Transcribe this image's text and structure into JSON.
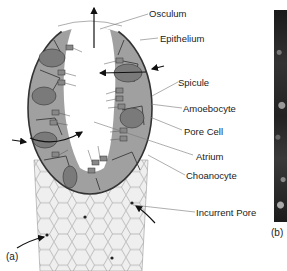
{
  "figure": {
    "panel_a_label": "(a)",
    "panel_b_label": "(b)",
    "labels": [
      {
        "id": "osculum",
        "text": "Osculum"
      },
      {
        "id": "epithelium",
        "text": "Epithelium"
      },
      {
        "id": "spicule",
        "text": "Spicule"
      },
      {
        "id": "amoebocyte",
        "text": "Amoebocyte"
      },
      {
        "id": "pore-cell",
        "text": "Pore Cell"
      },
      {
        "id": "atrium",
        "text": "Atrium"
      },
      {
        "id": "choanocyte",
        "text": "Choanocyte"
      },
      {
        "id": "incurrent-pore",
        "text": "Incurrent Pore"
      }
    ],
    "colors": {
      "wall_fill": "#9a9a9a",
      "wall_outline": "#3a3a3a",
      "cell_fill": "#7c7c7c",
      "tube_fill": "#eeeeee",
      "atrium_fill": "#ffffff",
      "photo_dark": "#1e1e1e"
    }
  }
}
